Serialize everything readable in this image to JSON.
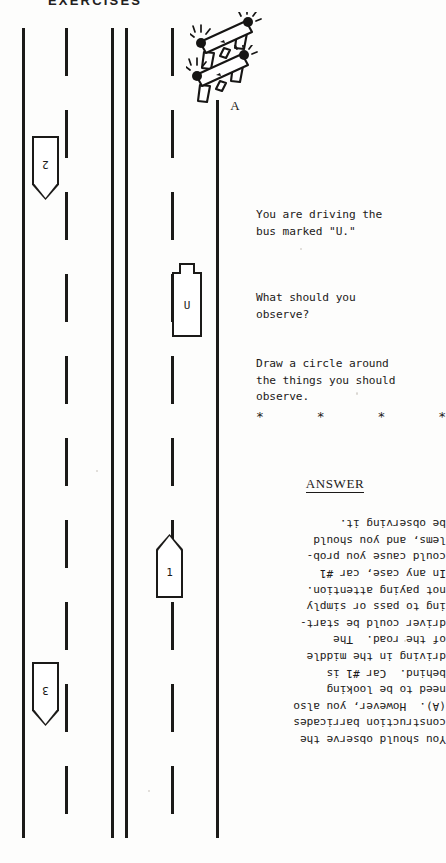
{
  "page": {
    "header": "EXERCISES",
    "background_color": "#fdfdfc",
    "ink_color": "#1b1a18"
  },
  "diagram": {
    "name": "roadway-scene",
    "lane_lines": [
      {
        "id": "left-edge-line",
        "style": "solid",
        "x": 22,
        "top": 28,
        "bottom": 838
      },
      {
        "id": "lane-divider-1",
        "style": "dashed",
        "x": 65,
        "top": 28,
        "bottom": 838
      },
      {
        "id": "center-line-left",
        "style": "solid",
        "x": 111,
        "top": 28,
        "bottom": 838
      },
      {
        "id": "center-line-right",
        "style": "solid",
        "x": 125,
        "top": 28,
        "bottom": 838
      },
      {
        "id": "lane-divider-2",
        "style": "dashed",
        "x": 171,
        "top": 28,
        "bottom": 838
      },
      {
        "id": "right-edge-line",
        "style": "solid",
        "x": 216,
        "top": 100,
        "bottom": 838
      }
    ],
    "vehicles": [
      {
        "id": "bus-u",
        "label": "U",
        "type": "bus",
        "heading": "up",
        "x": 172,
        "y": 263,
        "width": 30,
        "height": 74
      },
      {
        "id": "car-1",
        "label": "1",
        "type": "car",
        "heading": "up",
        "x": 156,
        "y": 534,
        "width": 27,
        "height": 64
      },
      {
        "id": "car-2",
        "label": "2",
        "type": "car",
        "heading": "down",
        "x": 32,
        "y": 136,
        "width": 27,
        "height": 64
      },
      {
        "id": "car-3",
        "label": "3",
        "type": "car",
        "heading": "down",
        "x": 32,
        "y": 662,
        "width": 27,
        "height": 64
      }
    ],
    "barricades": {
      "label": "A",
      "count": 2,
      "description": "construction barricades with flashing lights"
    }
  },
  "question": {
    "line_1": "You are driving the\nbus marked \"U.\"",
    "line_2": "What should you\nobserve?",
    "line_3": "Draw a circle around\nthe things you should\nobserve.",
    "separator": [
      "*",
      "*",
      "*",
      "*"
    ]
  },
  "answer": {
    "heading": "ANSWER",
    "body": "You should observe the\nconstruction barricades\n(A).  However, you also\nneed to be looking\nbehind.  Car #1 is\ndriving in the middle\nof the road.  The\ndriver could be start-\ning to pass or simply\nnot paying attention.\nIn any case, car #1\ncould cause you prob-\nlems, and you should\nbe observing it.",
    "rotated": true
  }
}
